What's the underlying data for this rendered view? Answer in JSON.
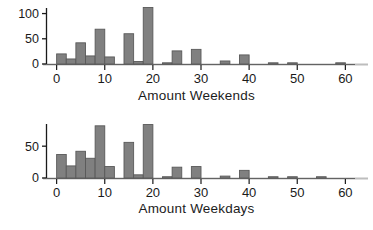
{
  "chart_data": [
    {
      "type": "bar",
      "title": "",
      "xlabel": "Amount Weekends",
      "ylabel": "",
      "xlim": [
        -2,
        62
      ],
      "ylim": [
        0,
        115
      ],
      "xticks": [
        0,
        10,
        20,
        30,
        40,
        50,
        60
      ],
      "yticks": [
        0,
        50,
        100
      ],
      "xticklabels": [
        "0",
        "10",
        "20",
        "30",
        "40",
        "50",
        "60"
      ],
      "yticklabels": [
        "0",
        "50",
        "100"
      ],
      "grid": false,
      "legend": false,
      "bin_width": 2,
      "bin_starts": [
        0,
        2,
        4,
        6,
        8,
        10,
        14,
        16,
        18,
        22,
        24,
        28,
        34,
        38,
        44,
        48,
        58
      ],
      "values": [
        20,
        10,
        42,
        16,
        69,
        14,
        60,
        5,
        112,
        2,
        26,
        29,
        6,
        18,
        2,
        2,
        2
      ],
      "bar_color": "#808080",
      "bar_edge_color": "#595959"
    },
    {
      "type": "bar",
      "title": "",
      "xlabel": "Amount Weekdays",
      "ylabel": "",
      "xlim": [
        -2,
        62
      ],
      "ylim": [
        0,
        88
      ],
      "xticks": [
        0,
        10,
        20,
        30,
        40,
        50,
        60
      ],
      "yticks": [
        0,
        50
      ],
      "xticklabels": [
        "0",
        "10",
        "20",
        "30",
        "40",
        "50",
        "60"
      ],
      "yticklabels": [
        "0",
        "50"
      ],
      "grid": false,
      "legend": false,
      "bin_width": 2,
      "bin_starts": [
        0,
        2,
        4,
        6,
        8,
        10,
        14,
        16,
        18,
        22,
        24,
        28,
        34,
        38,
        44,
        48,
        54
      ],
      "values": [
        37,
        19,
        42,
        31,
        82,
        18,
        56,
        5,
        84,
        2,
        17,
        18,
        3,
        12,
        2,
        2,
        2
      ],
      "bar_color": "#808080",
      "bar_edge_color": "#595959"
    }
  ],
  "panels": {
    "weekends": {
      "axis_title": "Amount Weekends",
      "ytick_labels": [
        "100",
        "50",
        "0"
      ],
      "xtick_labels": [
        "0",
        "10",
        "20",
        "30",
        "40",
        "50",
        "60"
      ]
    },
    "weekdays": {
      "axis_title": "Amount Weekdays",
      "ytick_labels": [
        "50",
        "0"
      ],
      "xtick_labels": [
        "0",
        "10",
        "20",
        "30",
        "40",
        "50",
        "60"
      ]
    }
  },
  "colors": {
    "bar_fill": "#808080",
    "bar_edge": "#595959",
    "axis": "#1a1a1a",
    "baseline": "#bdbdbd",
    "text": "#1a1a1a",
    "background": "#ffffff"
  }
}
